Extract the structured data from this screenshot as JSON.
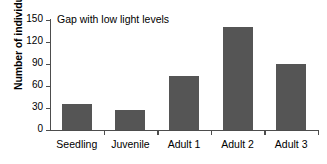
{
  "chart_data": {
    "type": "bar",
    "title": "Gap with low light levels",
    "xlabel": "",
    "ylabel": "Number of individuals",
    "categories": [
      "Seedling",
      "Juvenile",
      "Adult 1",
      "Adult 2",
      "Adult 3"
    ],
    "values": [
      36,
      27,
      73,
      140,
      90
    ],
    "ylim": [
      0,
      150
    ],
    "yticks": [
      0,
      30,
      60,
      90,
      120,
      150
    ],
    "ytick_labels": [
      "0",
      "30",
      "60",
      "90",
      "120",
      "150"
    ],
    "grid": false,
    "legend": null,
    "bar_color": "#555555",
    "axis_color": "#4d4d4d"
  }
}
